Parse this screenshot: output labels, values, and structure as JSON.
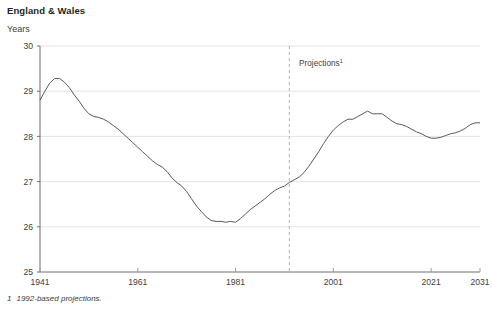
{
  "title": "England & Wales",
  "y_unit_label": "Years",
  "footnote": {
    "marker": "1",
    "text": "1992-based projections."
  },
  "annotation": {
    "label": "Projections",
    "superscript": "1",
    "at_year": 1994
  },
  "chart_data": {
    "type": "line",
    "title": "England & Wales",
    "xlabel": "",
    "ylabel": "Years",
    "ylim": [
      25,
      30
    ],
    "xlim": [
      1941,
      2031
    ],
    "yticks": [
      25,
      26,
      27,
      28,
      29,
      30
    ],
    "xticks": [
      1941,
      1961,
      1981,
      2001,
      2021,
      2031
    ],
    "grid": "horizontal",
    "legend": "none",
    "annotations": [
      {
        "text": "Projections1",
        "x": 1994,
        "y": 29.6,
        "type": "text"
      },
      {
        "type": "vline",
        "x": 1992,
        "style": "dashed",
        "color": "#b3b3b3"
      }
    ],
    "series": [
      {
        "name": "Mean age at childbearing",
        "color": "#595959",
        "x": [
          1941,
          1942,
          1943,
          1944,
          1945,
          1946,
          1947,
          1948,
          1949,
          1950,
          1951,
          1952,
          1953,
          1954,
          1955,
          1956,
          1957,
          1958,
          1959,
          1960,
          1961,
          1962,
          1963,
          1964,
          1965,
          1966,
          1967,
          1968,
          1969,
          1970,
          1971,
          1972,
          1973,
          1974,
          1975,
          1976,
          1977,
          1978,
          1979,
          1980,
          1981,
          1982,
          1983,
          1984,
          1985,
          1986,
          1987,
          1988,
          1989,
          1990,
          1991,
          1992,
          1993,
          1994,
          1995,
          1996,
          1997,
          1998,
          1999,
          2000,
          2001,
          2002,
          2003,
          2004,
          2005,
          2006,
          2007,
          2008,
          2009,
          2010,
          2011,
          2012,
          2013,
          2014,
          2015,
          2016,
          2017,
          2018,
          2019,
          2020,
          2021,
          2022,
          2023,
          2024,
          2025,
          2026,
          2027,
          2028,
          2029,
          2030,
          2031
        ],
        "y": [
          28.8,
          29.0,
          29.18,
          29.28,
          29.28,
          29.2,
          29.08,
          28.92,
          28.78,
          28.62,
          28.5,
          28.44,
          28.42,
          28.38,
          28.32,
          28.24,
          28.16,
          28.06,
          27.96,
          27.86,
          27.76,
          27.66,
          27.56,
          27.46,
          27.38,
          27.32,
          27.22,
          27.08,
          26.98,
          26.9,
          26.78,
          26.62,
          26.46,
          26.34,
          26.22,
          26.14,
          26.12,
          26.12,
          26.1,
          26.12,
          26.1,
          26.18,
          26.28,
          26.38,
          26.46,
          26.54,
          26.62,
          26.72,
          26.8,
          26.86,
          26.9,
          26.98,
          27.04,
          27.1,
          27.2,
          27.34,
          27.5,
          27.66,
          27.84,
          28.0,
          28.14,
          28.24,
          28.32,
          28.38,
          28.38,
          28.44,
          28.5,
          28.56,
          28.5,
          28.5,
          28.5,
          28.42,
          28.34,
          28.28,
          28.26,
          28.22,
          28.16,
          28.1,
          28.06,
          28.0,
          27.96,
          27.96,
          27.98,
          28.02,
          28.06,
          28.08,
          28.12,
          28.18,
          28.26,
          28.3,
          28.3
        ]
      }
    ]
  }
}
